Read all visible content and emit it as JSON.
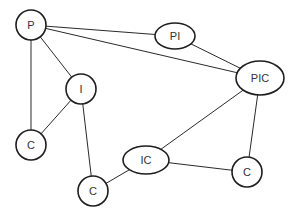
{
  "diagram": {
    "type": "graph",
    "nodes": [
      {
        "id": "P",
        "label": "P",
        "shape": "circle"
      },
      {
        "id": "PI",
        "label": "PI",
        "shape": "ellipse"
      },
      {
        "id": "PIC",
        "label": "PIC",
        "shape": "ellipse"
      },
      {
        "id": "I",
        "label": "I",
        "shape": "circle"
      },
      {
        "id": "C1",
        "label": "C",
        "shape": "circle"
      },
      {
        "id": "IC",
        "label": "IC",
        "shape": "ellipse"
      },
      {
        "id": "C2",
        "label": "C",
        "shape": "circle"
      },
      {
        "id": "C3",
        "label": "C",
        "shape": "circle"
      }
    ],
    "edges": [
      {
        "from": "P",
        "to": "PI"
      },
      {
        "from": "P",
        "to": "PIC"
      },
      {
        "from": "P",
        "to": "I"
      },
      {
        "from": "P",
        "to": "C1"
      },
      {
        "from": "I",
        "to": "C1"
      },
      {
        "from": "I",
        "to": "C3"
      },
      {
        "from": "PI",
        "to": "PIC"
      },
      {
        "from": "PIC",
        "to": "IC"
      },
      {
        "from": "PIC",
        "to": "C2"
      },
      {
        "from": "IC",
        "to": "C2"
      },
      {
        "from": "IC",
        "to": "C3"
      }
    ]
  }
}
